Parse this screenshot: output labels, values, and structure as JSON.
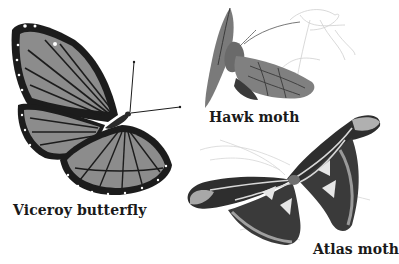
{
  "figure": {
    "type": "illustration",
    "style": "grayscale",
    "specimens": [
      {
        "name": "Viceroy butterfly",
        "label": "Viceroy butterfly",
        "position": "left"
      },
      {
        "name": "Hawk moth",
        "label": "Hawk moth",
        "position": "top-right"
      },
      {
        "name": "Atlas moth",
        "label": "Atlas moth",
        "position": "bottom-right"
      }
    ]
  },
  "labels": {
    "viceroy": "Viceroy butterfly",
    "hawk": "Hawk moth",
    "atlas": "Atlas moth"
  },
  "colors": {
    "background": "#ffffff",
    "wing_fill": "#8a8a8a",
    "wing_dark": "#1a1a1a",
    "plant_sketch": "#cccccc"
  }
}
